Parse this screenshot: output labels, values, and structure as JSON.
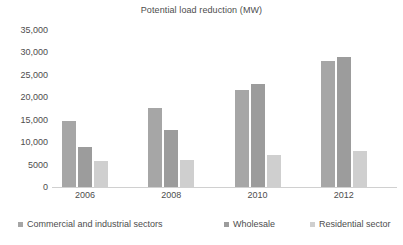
{
  "chart_data": {
    "type": "bar",
    "title": "Potential load reduction (MW)",
    "xlabel": "",
    "ylabel": "",
    "categories": [
      "2006",
      "2008",
      "2010",
      "2012"
    ],
    "series": [
      {
        "name": "Commercial and industrial sectors",
        "color": "#a6a6a6",
        "values": [
          14700,
          17700,
          21600,
          28100
        ]
      },
      {
        "name": "Wholesale",
        "color": "#9c9c9c",
        "values": [
          9000,
          12800,
          23000,
          28900
        ]
      },
      {
        "name": "Residential sector",
        "color": "#cfcfcf",
        "values": [
          5800,
          6100,
          7200,
          8100
        ]
      }
    ],
    "ylim": [
      0,
      35000
    ],
    "ytick_values": [
      35000,
      30000,
      25000,
      20000,
      15000,
      10000,
      5000,
      0
    ],
    "ytick_labels": [
      "35,000",
      "30,000",
      "25,000",
      "20,000",
      "15,000",
      "10,000",
      "5000",
      "0"
    ],
    "grid": false,
    "legend_position": "bottom"
  },
  "legend": {
    "items": [
      {
        "label": "Commercial and industrial sectors",
        "color": "#a6a6a6"
      },
      {
        "label": "Wholesale",
        "color": "#9c9c9c"
      },
      {
        "label": "Residential sector",
        "color": "#cfcfcf"
      }
    ]
  }
}
